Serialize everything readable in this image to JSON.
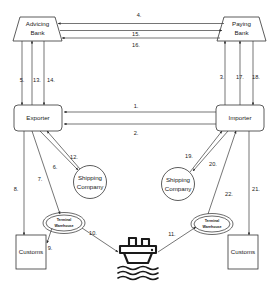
{
  "diagram": {
    "nodes": {
      "advising_bank": {
        "line1": "Advicing",
        "line2": "Bank"
      },
      "paying_bank": {
        "line1": "Paying",
        "line2": "Bank"
      },
      "exporter": {
        "label": "Exporter"
      },
      "importer": {
        "label": "Importer"
      },
      "shipping_company_left": {
        "line1": "Shipping",
        "line2": "Company"
      },
      "shipping_company_right": {
        "line1": "Shipping",
        "line2": "Company"
      },
      "terminal_warehouse_left": {
        "line1": "Terminal",
        "line2": "Warehouse"
      },
      "terminal_warehouse_right": {
        "line1": "Terminal",
        "line2": "Warehouse"
      },
      "customs_left": {
        "label": "Customs"
      },
      "customs_right": {
        "label": "Customs"
      },
      "ship": {
        "name": "ship-icon"
      }
    },
    "edge_labels": {
      "e1": "1.",
      "e2": "2.",
      "e3": "3.",
      "e4": "4.",
      "e5": "5.",
      "e6": "6.",
      "e7": "7.",
      "e8": "8.",
      "e9": "9.",
      "e10": "10.",
      "e11": "11.",
      "e12": "12.",
      "e13": "13.",
      "e14": "14.",
      "e15": "15.",
      "e16": "16.",
      "e17": "17.",
      "e18": "18.",
      "e19": "19.",
      "e20": "20.",
      "e21": "21.",
      "e22": "22."
    },
    "colors": {
      "stroke": "#333333",
      "line": "#3a3a3a",
      "text": "#1a1a1a",
      "background": "#ffffff"
    }
  }
}
